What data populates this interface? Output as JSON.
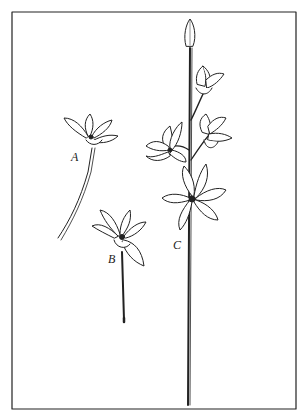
{
  "figure": {
    "labels": {
      "a": "A",
      "b": "B",
      "c": "C"
    },
    "colors": {
      "ink": "#222222",
      "paper": "#ffffff"
    }
  }
}
